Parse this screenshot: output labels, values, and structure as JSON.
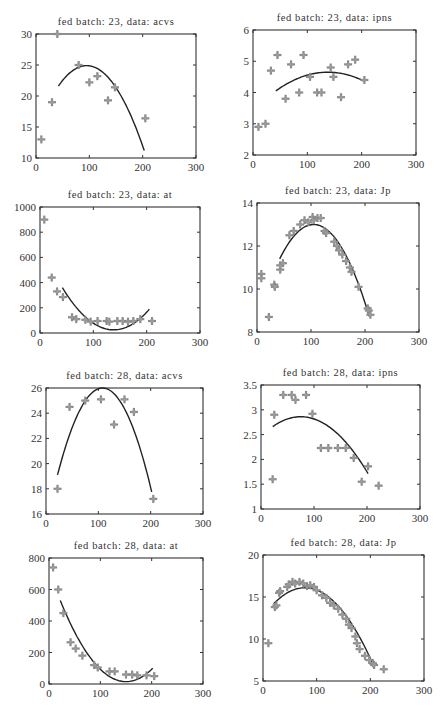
{
  "figure": {
    "layout": "4 rows x 2 columns grid of scatter plots with quadratic fit curves"
  },
  "chart_data": [
    {
      "type": "scatter",
      "title": "fed batch: 23, data: acvs",
      "xlabel": "",
      "ylabel": "",
      "xlim": [
        0,
        300
      ],
      "ylim": [
        10,
        30
      ],
      "xticks": [
        0,
        100,
        200,
        300
      ],
      "yticks": [
        10,
        15,
        20,
        25,
        30
      ],
      "grid": false,
      "box": {
        "left": 36,
        "top": 34,
        "right": 196,
        "bottom": 158
      },
      "points": [
        [
          10,
          13
        ],
        [
          30,
          19
        ],
        [
          40,
          30
        ],
        [
          80,
          25
        ],
        [
          100,
          22.2
        ],
        [
          115,
          23.2
        ],
        [
          135,
          19.3
        ],
        [
          148,
          21.4
        ],
        [
          205,
          16.4
        ]
      ],
      "fit": {
        "type": "quadratic",
        "x_range": [
          42,
          203
        ],
        "vertex": [
          95,
          24.9
        ],
        "y_at_start": 21.6
      }
    },
    {
      "type": "scatter",
      "title": "fed batch: 23, data: ipns",
      "xlabel": "",
      "ylabel": "",
      "xlim": [
        0,
        300
      ],
      "ylim": [
        2,
        6
      ],
      "xticks": [
        0,
        100,
        200,
        300
      ],
      "yticks": [
        2,
        3,
        4,
        5,
        6
      ],
      "grid": false,
      "box": {
        "left": 253,
        "top": 30,
        "right": 416,
        "bottom": 155
      },
      "points": [
        [
          10,
          2.9
        ],
        [
          23,
          3.0
        ],
        [
          33,
          4.7
        ],
        [
          45,
          5.2
        ],
        [
          60,
          3.8
        ],
        [
          70,
          4.9
        ],
        [
          85,
          4.0
        ],
        [
          93,
          5.2
        ],
        [
          105,
          4.5
        ],
        [
          118,
          4.0
        ],
        [
          126,
          4.0
        ],
        [
          143,
          4.8
        ],
        [
          148,
          4.5
        ],
        [
          162,
          3.85
        ],
        [
          175,
          4.9
        ],
        [
          188,
          5.05
        ],
        [
          205,
          4.4
        ]
      ],
      "fit": {
        "type": "quadratic",
        "x_range": [
          42,
          205
        ],
        "vertex": [
          138,
          4.65
        ],
        "y_at_start": 4.05
      }
    },
    {
      "type": "scatter",
      "title": "fed batch: 23, data: at",
      "xlabel": "",
      "ylabel": "",
      "xlim": [
        0,
        300
      ],
      "ylim": [
        0,
        1000
      ],
      "xticks": [
        0,
        100,
        200,
        300
      ],
      "yticks": [
        0,
        200,
        400,
        600,
        800,
        1000
      ],
      "grid": false,
      "box": {
        "left": 40,
        "top": 207,
        "right": 200,
        "bottom": 333
      },
      "points": [
        [
          8,
          900
        ],
        [
          22,
          440
        ],
        [
          32,
          330
        ],
        [
          43,
          285
        ],
        [
          60,
          125
        ],
        [
          68,
          110
        ],
        [
          85,
          105
        ],
        [
          95,
          90
        ],
        [
          108,
          95
        ],
        [
          125,
          95
        ],
        [
          130,
          90
        ],
        [
          145,
          95
        ],
        [
          155,
          95
        ],
        [
          165,
          90
        ],
        [
          175,
          95
        ],
        [
          188,
          110
        ],
        [
          210,
          95
        ]
      ],
      "fit": {
        "type": "quadratic",
        "x_range": [
          42,
          205
        ],
        "vertex": [
          138,
          25
        ],
        "y_at_start": 360
      }
    },
    {
      "type": "scatter",
      "title": "fed batch: 23, data: Jp",
      "xlabel": "",
      "ylabel": "",
      "xlim": [
        0,
        300
      ],
      "ylim": [
        8,
        14
      ],
      "xticks": [
        0,
        100,
        200,
        300
      ],
      "yticks": [
        8,
        10,
        12,
        14
      ],
      "grid": false,
      "box": {
        "left": 257,
        "top": 203,
        "right": 419,
        "bottom": 332
      },
      "points": [
        [
          8,
          10.7
        ],
        [
          8,
          10.5
        ],
        [
          22,
          8.7
        ],
        [
          32,
          10.2
        ],
        [
          33,
          10.1
        ],
        [
          43,
          10.9
        ],
        [
          43,
          11.1
        ],
        [
          48,
          11.2
        ],
        [
          60,
          12.5
        ],
        [
          68,
          12.7
        ],
        [
          80,
          13.0
        ],
        [
          88,
          13.2
        ],
        [
          95,
          13.1
        ],
        [
          103,
          13.35
        ],
        [
          105,
          13.2
        ],
        [
          112,
          13.3
        ],
        [
          118,
          13.3
        ],
        [
          125,
          12.7
        ],
        [
          128,
          12.6
        ],
        [
          143,
          12.2
        ],
        [
          148,
          12.0
        ],
        [
          152,
          11.8
        ],
        [
          158,
          11.6
        ],
        [
          165,
          11.3
        ],
        [
          172,
          11.0
        ],
        [
          175,
          10.8
        ],
        [
          188,
          10.1
        ],
        [
          205,
          9.1
        ],
        [
          207,
          9.0
        ],
        [
          210,
          8.8
        ]
      ],
      "fit": {
        "type": "quadratic",
        "x_range": [
          42,
          208
        ],
        "vertex": [
          105,
          13.0
        ],
        "y_at_start": 11.4
      }
    },
    {
      "type": "scatter",
      "title": "fed batch: 28, data: acvs",
      "xlabel": "",
      "ylabel": "",
      "xlim": [
        0,
        300
      ],
      "ylim": [
        16,
        26
      ],
      "xticks": [
        0,
        100,
        200,
        300
      ],
      "yticks": [
        16,
        18,
        20,
        22,
        24,
        26
      ],
      "grid": false,
      "box": {
        "left": 46,
        "top": 388,
        "right": 203,
        "bottom": 514
      },
      "points": [
        [
          22,
          18
        ],
        [
          45,
          24.5
        ],
        [
          75,
          25.0
        ],
        [
          105,
          25.1
        ],
        [
          130,
          23.1
        ],
        [
          150,
          25.1
        ],
        [
          168,
          24.1
        ],
        [
          205,
          17.2
        ]
      ],
      "fit": {
        "type": "quadratic",
        "x_range": [
          22,
          202
        ],
        "vertex": [
          108,
          26.0
        ],
        "y_at_start": 19.1
      }
    },
    {
      "type": "scatter",
      "title": "fed batch: 28, data: ipns",
      "xlabel": "",
      "ylabel": "",
      "xlim": [
        0,
        300
      ],
      "ylim": [
        1,
        3.5
      ],
      "xticks": [
        0,
        100,
        200,
        300
      ],
      "yticks": [
        1,
        1.5,
        2,
        2.5,
        3,
        3.5
      ],
      "grid": false,
      "box": {
        "left": 261,
        "top": 385,
        "right": 420,
        "bottom": 509
      },
      "points": [
        [
          22,
          1.6
        ],
        [
          25,
          2.9
        ],
        [
          42,
          3.3
        ],
        [
          58,
          3.3
        ],
        [
          65,
          3.2
        ],
        [
          85,
          3.3
        ],
        [
          97,
          2.92
        ],
        [
          113,
          2.23
        ],
        [
          127,
          2.23
        ],
        [
          145,
          2.23
        ],
        [
          160,
          2.23
        ],
        [
          175,
          2.03
        ],
        [
          190,
          1.55
        ],
        [
          202,
          1.86
        ],
        [
          222,
          1.47
        ]
      ],
      "fit": {
        "type": "quadratic",
        "x_range": [
          22,
          202
        ],
        "vertex": [
          75,
          2.86
        ],
        "y_at_start": 2.66
      }
    },
    {
      "type": "scatter",
      "title": "fed batch: 28, data: at",
      "xlabel": "",
      "ylabel": "",
      "xlim": [
        0,
        300
      ],
      "ylim": [
        0,
        800
      ],
      "xticks": [
        0,
        100,
        200,
        300
      ],
      "yticks": [
        0,
        200,
        400,
        600,
        800
      ],
      "grid": false,
      "box": {
        "left": 49,
        "top": 558,
        "right": 203,
        "bottom": 684
      },
      "points": [
        [
          8,
          740
        ],
        [
          18,
          600
        ],
        [
          28,
          450
        ],
        [
          42,
          265
        ],
        [
          52,
          225
        ],
        [
          65,
          180
        ],
        [
          88,
          120
        ],
        [
          95,
          105
        ],
        [
          118,
          80
        ],
        [
          128,
          80
        ],
        [
          150,
          60
        ],
        [
          162,
          60
        ],
        [
          172,
          55
        ],
        [
          190,
          55
        ],
        [
          205,
          50
        ]
      ],
      "fit": {
        "type": "quadratic",
        "x_range": [
          22,
          202
        ],
        "vertex": [
          150,
          15
        ],
        "y_at_start": 530
      }
    },
    {
      "type": "scatter",
      "title": "fed batch: 28, data: Jp",
      "xlabel": "",
      "ylabel": "",
      "xlim": [
        0,
        300
      ],
      "ylim": [
        5,
        20
      ],
      "xticks": [
        0,
        100,
        200,
        300
      ],
      "yticks": [
        5,
        10,
        15,
        20
      ],
      "grid": false,
      "box": {
        "left": 263,
        "top": 555,
        "right": 424,
        "bottom": 681
      },
      "points": [
        [
          10,
          9.5
        ],
        [
          22,
          13.8
        ],
        [
          25,
          14.0
        ],
        [
          30,
          15.5
        ],
        [
          32,
          15.7
        ],
        [
          45,
          16.2
        ],
        [
          48,
          16.5
        ],
        [
          55,
          16.8
        ],
        [
          60,
          16.6
        ],
        [
          68,
          16.8
        ],
        [
          75,
          16.6
        ],
        [
          82,
          16.3
        ],
        [
          88,
          16.4
        ],
        [
          95,
          16.2
        ],
        [
          100,
          15.8
        ],
        [
          110,
          15.2
        ],
        [
          118,
          14.9
        ],
        [
          125,
          14.3
        ],
        [
          132,
          14.0
        ],
        [
          140,
          13.6
        ],
        [
          148,
          12.9
        ],
        [
          155,
          12.4
        ],
        [
          160,
          11.7
        ],
        [
          165,
          11.3
        ],
        [
          172,
          10.3
        ],
        [
          175,
          9.5
        ],
        [
          180,
          8.8
        ],
        [
          190,
          8.0
        ],
        [
          198,
          7.5
        ],
        [
          205,
          7.1
        ],
        [
          207,
          6.9
        ],
        [
          225,
          6.4
        ]
      ],
      "fit": {
        "type": "quadratic",
        "x_range": [
          20,
          207
        ],
        "vertex": [
          78,
          16.1
        ],
        "y_at_start": 14.2
      }
    }
  ]
}
